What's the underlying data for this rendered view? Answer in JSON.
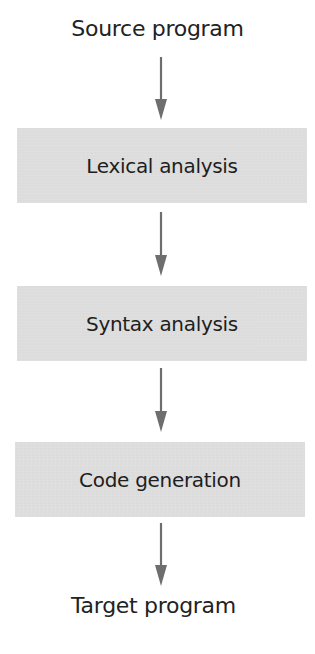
{
  "diagram": {
    "type": "flowchart",
    "direction": "top-to-bottom",
    "input": {
      "label": "Source program"
    },
    "stages": [
      {
        "label": "Lexical analysis"
      },
      {
        "label": "Syntax analysis"
      },
      {
        "label": "Code generation"
      }
    ],
    "output": {
      "label": "Target program"
    },
    "edges": [
      {
        "from": "Source program",
        "to": "Lexical analysis"
      },
      {
        "from": "Lexical analysis",
        "to": "Syntax analysis"
      },
      {
        "from": "Syntax analysis",
        "to": "Code generation"
      },
      {
        "from": "Code generation",
        "to": "Target program"
      }
    ],
    "colors": {
      "box_fill": "#dcdcdc",
      "arrow": "#6e6e6e",
      "text": "#1e1e1e",
      "background": "#ffffff"
    }
  }
}
